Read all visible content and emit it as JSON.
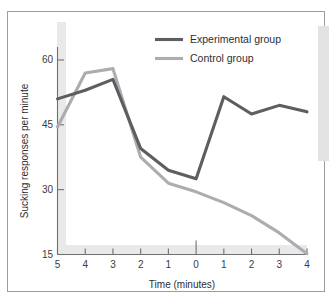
{
  "figure": {
    "kind": "line-chart",
    "background_color": "#ffffff",
    "frame_border_color": "#9b9ba0"
  },
  "legend": {
    "position": "top-right-inside",
    "entries": [
      {
        "label": "Experimental group",
        "color": "#5d5d62",
        "width": 3.1
      },
      {
        "label": "Control group",
        "color": "#adadb1",
        "width": 3.1
      }
    ]
  },
  "axes": {
    "x": {
      "title": "Time (minutes)",
      "tick_labels": [
        "5",
        "4",
        "3",
        "2",
        "1",
        "0",
        "1",
        "2",
        "3",
        "4"
      ],
      "zero_index": 5
    },
    "y": {
      "title": "Sucking responses per minute",
      "tick_labels": [
        "15",
        "30",
        "45",
        "60"
      ],
      "min": 15,
      "max": 63
    }
  },
  "chart_data": {
    "type": "line",
    "title": "",
    "subtitle": "",
    "xlabel": "Time (minutes)",
    "ylabel": "Sucking responses per minute",
    "x": [
      -5,
      -4,
      -3,
      -2,
      -1,
      0,
      1,
      2,
      3,
      4
    ],
    "xtick_labels": [
      "5",
      "4",
      "3",
      "2",
      "1",
      "0",
      "1",
      "2",
      "3",
      "4"
    ],
    "ytick_labels": [
      "15",
      "30",
      "45",
      "60"
    ],
    "ylim": [
      15,
      63
    ],
    "yticks": [
      15,
      30,
      45,
      60
    ],
    "grid": false,
    "legend_position": "upper right",
    "annotations": [
      "vertical tick at time 0 marks onset"
    ],
    "series": [
      {
        "name": "Experimental group",
        "color": "#5d5d62",
        "values": [
          51.0,
          53.0,
          55.5,
          39.5,
          34.5,
          32.5,
          51.5,
          47.5,
          49.5,
          48.0
        ]
      },
      {
        "name": "Control group",
        "color": "#adadb1",
        "values": [
          44.5,
          57.0,
          58.0,
          37.5,
          31.5,
          29.5,
          27.0,
          24.0,
          20.0,
          15.2
        ]
      }
    ]
  }
}
